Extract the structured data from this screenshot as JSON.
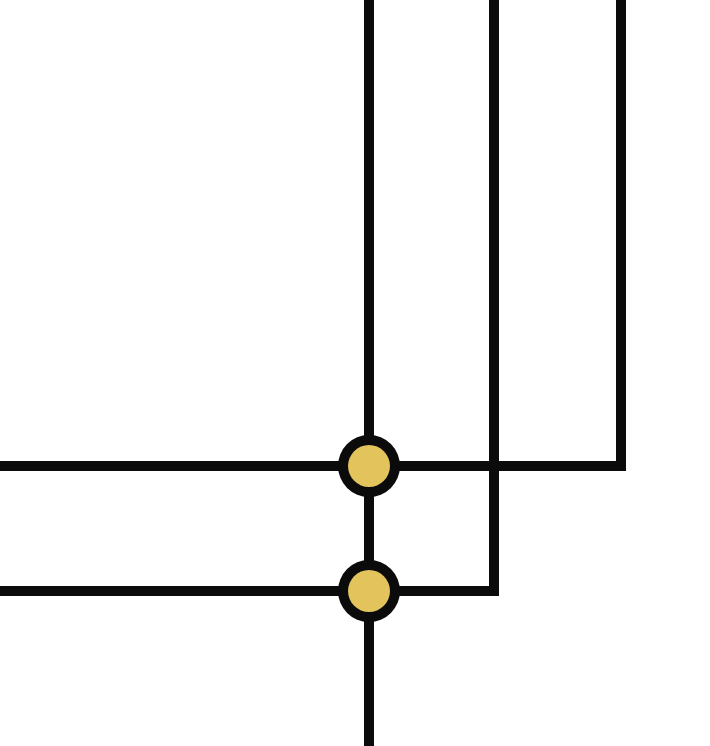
{
  "diagram": {
    "type": "circuit-wiring",
    "width": 710,
    "height": 746,
    "colors": {
      "background": "#ffffff",
      "wire": "#0b0b0b",
      "node_fill": "#e2c35c",
      "node_stroke": "#0b0b0b"
    },
    "stroke_width": 10,
    "wires": [
      {
        "id": "vertical-left",
        "points": [
          [
            369,
            0
          ],
          [
            369,
            746
          ]
        ]
      },
      {
        "id": "vertical-middle",
        "points": [
          [
            494,
            0
          ],
          [
            494,
            591
          ],
          [
            0,
            591
          ]
        ]
      },
      {
        "id": "vertical-right",
        "points": [
          [
            621,
            0
          ],
          [
            621,
            466
          ],
          [
            0,
            466
          ]
        ]
      }
    ],
    "nodes": [
      {
        "id": "junction-top",
        "cx": 369,
        "cy": 466,
        "r_outer": 31,
        "r_inner": 21
      },
      {
        "id": "junction-bottom",
        "cx": 369,
        "cy": 591,
        "r_outer": 31,
        "r_inner": 21
      }
    ]
  }
}
